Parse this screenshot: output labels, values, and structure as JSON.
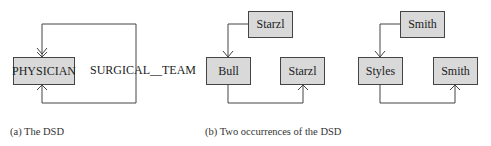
{
  "panel_a": {
    "entity": "PHYSICIAN",
    "relationship": "SURGICAL__TEAM",
    "caption": "(a) The DSD"
  },
  "panel_b": {
    "caption": "(b) Two occurrences of the DSD",
    "occurrence_1": {
      "owner": "Starzl",
      "member": "Bull",
      "next": "Starzl"
    },
    "occurrence_2": {
      "owner": "Smith",
      "member": "Styles",
      "next": "Smith"
    }
  },
  "colors": {
    "box_fill": "#d9d9d9",
    "line": "#444444"
  }
}
